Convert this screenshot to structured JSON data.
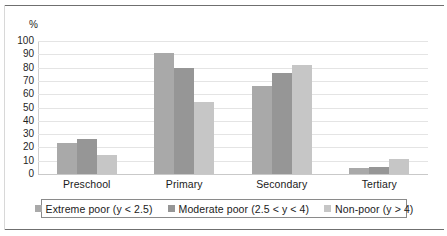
{
  "chart_data": {
    "type": "bar",
    "title": "",
    "subtitle": "",
    "xlabel": "",
    "ylabel": "%",
    "ylim": [
      0,
      100
    ],
    "yticks": [
      0,
      10,
      20,
      30,
      40,
      50,
      60,
      70,
      80,
      90,
      100
    ],
    "ytick_labels": [
      "0",
      "10",
      "20",
      "30",
      "40",
      "50",
      "60",
      "70",
      "80",
      "90",
      "100"
    ],
    "grid": true,
    "grid_axis": "y",
    "legend_position": "bottom",
    "legend_boxed": true,
    "categories": [
      "Preschool",
      "Primary",
      "Secondary",
      "Tertiary"
    ],
    "series": [
      {
        "name": "Extreme poor (y < 2.5)",
        "color": "#a9a9a9",
        "values": [
          23,
          91,
          66,
          4.5
        ]
      },
      {
        "name": "Moderate poor (2.5 < y < 4)",
        "color": "#969696",
        "values": [
          26,
          80,
          76,
          5.5
        ]
      },
      {
        "name": "Non-poor (y > 4)",
        "color": "#c6c6c6",
        "values": [
          14,
          54,
          82,
          11
        ]
      }
    ]
  },
  "axes": {
    "y_unit_label": "%"
  },
  "colors": {
    "series_1": "#a9a9a9",
    "series_2": "#969696",
    "series_3": "#c6c6c6",
    "gridline": "#e4e4e4",
    "frame_rule": "#6f6f6f",
    "legend_border": "#8a8a8a",
    "text": "#1b1b1b"
  }
}
